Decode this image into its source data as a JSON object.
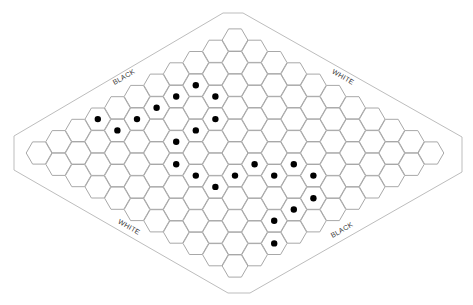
{
  "game": {
    "name": "Hex",
    "board_size": 11,
    "colors": {
      "background": "#ffffff",
      "grid_line": "#a8a8a8",
      "border_line": "#bdbdbd",
      "stone": "#000000",
      "label": "#333333"
    },
    "labels": {
      "top_left": "BLACK",
      "top_right": "WHITE",
      "bottom_left": "WHITE",
      "bottom_right": "BLACK"
    },
    "stones": [
      {
        "row": 3,
        "col": 1,
        "color": "black"
      },
      {
        "row": 4,
        "col": 1,
        "color": "black"
      },
      {
        "row": 3,
        "col": 2,
        "color": "black"
      },
      {
        "row": 5,
        "col": 1,
        "color": "black"
      },
      {
        "row": 7,
        "col": 0,
        "color": "black"
      },
      {
        "row": 6,
        "col": 1,
        "color": "black"
      },
      {
        "row": 4,
        "col": 3,
        "color": "black"
      },
      {
        "row": 7,
        "col": 1,
        "color": "black"
      },
      {
        "row": 5,
        "col": 3,
        "color": "black"
      },
      {
        "row": 6,
        "col": 3,
        "color": "black"
      },
      {
        "row": 7,
        "col": 4,
        "color": "black"
      },
      {
        "row": 5,
        "col": 6,
        "color": "black"
      },
      {
        "row": 4,
        "col": 7,
        "color": "black"
      },
      {
        "row": 7,
        "col": 5,
        "color": "black"
      },
      {
        "row": 6,
        "col": 6,
        "color": "black"
      },
      {
        "row": 5,
        "col": 7,
        "color": "black"
      },
      {
        "row": 4,
        "col": 8,
        "color": "black"
      },
      {
        "row": 7,
        "col": 6,
        "color": "black"
      },
      {
        "row": 5,
        "col": 9,
        "color": "black"
      },
      {
        "row": 6,
        "col": 9,
        "color": "black"
      },
      {
        "row": 7,
        "col": 9,
        "color": "black"
      },
      {
        "row": 8,
        "col": 10,
        "color": "black"
      }
    ]
  }
}
